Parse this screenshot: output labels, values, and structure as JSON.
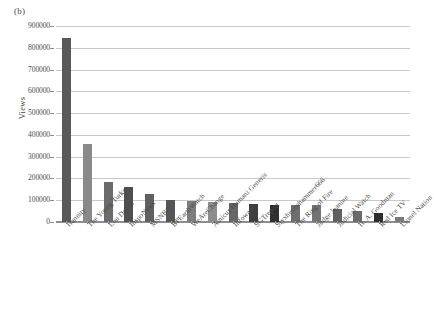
{
  "panel": {
    "label": "(b)"
  },
  "chart_data": {
    "type": "bar",
    "title": "",
    "subtitle": "",
    "xlabel": "",
    "ylabel": "Views",
    "ylim": [
      0,
      900000
    ],
    "ytick_step": 100000,
    "ytick_labels": [
      "0",
      "100000",
      "200000",
      "300000",
      "400000",
      "500000",
      "600000",
      "700000",
      "800000",
      "900000"
    ],
    "grid": true,
    "legend": "none",
    "categories": [
      "Hannity",
      "The Young Turks",
      "Lou Dobbs",
      "InspoNews",
      "MSNBC",
      "BPEarthWatch",
      "WeAreChange",
      "Amicus Humani Generis",
      "Infowars",
      "SGTreport",
      "Styxhexenhammer666",
      "The Ring of Fire",
      "Judge Jeanine",
      "Judicial Watch",
      "H. A. Goodman",
      "Red Ice TV",
      "Lionel Nation"
    ],
    "values": [
      845000,
      358000,
      186000,
      163000,
      127000,
      99000,
      96000,
      92000,
      87000,
      82000,
      80000,
      78000,
      76000,
      62000,
      52000,
      41000,
      25000
    ],
    "bar_colors": [
      "#595959",
      "#8a8a8a",
      "#6b6b6b",
      "#4f4f4f",
      "#606060",
      "#555555",
      "#7d7d7d",
      "#8d8d8d",
      "#666666",
      "#3f3f3f",
      "#2f2f2f",
      "#6e6e6e",
      "#737373",
      "#606060",
      "#6a6a6a",
      "#2e2e2e",
      "#7a7a7a"
    ]
  },
  "axis": {
    "grid_color": "#c9c9c9",
    "baseline_color": "#8e8e8e",
    "text_color": "#4a4a4a"
  }
}
